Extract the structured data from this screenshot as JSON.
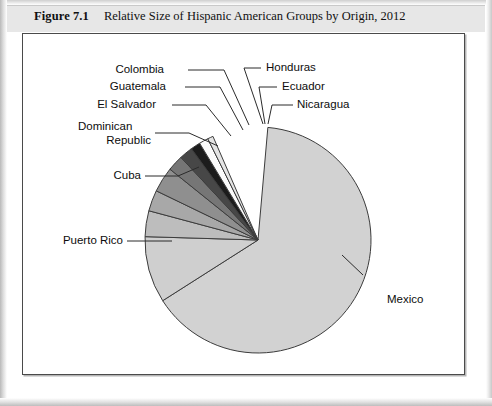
{
  "caption": {
    "figure_number": "Figure 7.1",
    "title": "Relative Size of Hispanic American Groups by Origin, 2012"
  },
  "chart_data": {
    "type": "pie",
    "title": "Relative Size of Hispanic American Groups by Origin, 2012",
    "xlabel": "",
    "ylabel": "",
    "legend_position": "none",
    "grid": false,
    "labels_as_callouts": true,
    "categories": [
      "Mexico",
      "Puerto Rico",
      "Cuba",
      "Dominican Republic",
      "El Salvador",
      "Guatemala",
      "Colombia",
      "Honduras",
      "Ecuador",
      "Nicaragua"
    ],
    "values": [
      64.6,
      9.5,
      3.7,
      3.0,
      3.6,
      2.3,
      1.9,
      1.4,
      1.3,
      0.8
    ],
    "unit": "percent",
    "slices": [
      {
        "name": "Mexico",
        "value": 64.6,
        "color": "#d2d2d2",
        "start_deg": 5.0,
        "end_deg": 237.5
      },
      {
        "name": "Puerto Rico",
        "value": 9.5,
        "color": "#cfcfcf",
        "start_deg": 237.5,
        "end_deg": 271.7
      },
      {
        "name": "Cuba",
        "value": 3.7,
        "color": "#bdbdbd",
        "start_deg": 271.7,
        "end_deg": 285.0
      },
      {
        "name": "Dominican Republic",
        "value": 3.0,
        "color": "#a8a8a8",
        "start_deg": 285.0,
        "end_deg": 295.8
      },
      {
        "name": "El Salvador",
        "value": 3.6,
        "color": "#8f8f8f",
        "start_deg": 295.8,
        "end_deg": 308.8
      },
      {
        "name": "Guatemala",
        "value": 2.3,
        "color": "#767676",
        "start_deg": 308.8,
        "end_deg": 317.0
      },
      {
        "name": "Colombia",
        "value": 1.9,
        "color": "#474747",
        "start_deg": 317.0,
        "end_deg": 323.9
      },
      {
        "name": "Honduras",
        "value": 1.4,
        "color": "#1c1c1c",
        "start_deg": 323.9,
        "end_deg": 328.9
      },
      {
        "name": "Ecuador",
        "value": 1.3,
        "color": "#fbfbfb",
        "start_deg": 328.9,
        "end_deg": 333.6
      },
      {
        "name": "Nicaragua",
        "value": 0.8,
        "color": "#e4e4e4",
        "start_deg": 333.6,
        "end_deg": 336.5
      }
    ],
    "callouts": [
      {
        "name": "Colombia",
        "label": "Colombia"
      },
      {
        "name": "Guatemala",
        "label": "Guatemala"
      },
      {
        "name": "El Salvador",
        "label": "El Salvador"
      },
      {
        "name": "Dominican Republic",
        "label_line1": "Dominican",
        "label_line2": "Republic"
      },
      {
        "name": "Cuba",
        "label": "Cuba"
      },
      {
        "name": "Puerto Rico",
        "label": "Puerto Rico"
      },
      {
        "name": "Honduras",
        "label": "Honduras"
      },
      {
        "name": "Ecuador",
        "label": "Ecuador"
      },
      {
        "name": "Nicaragua",
        "label": "Nicaragua"
      },
      {
        "name": "Mexico",
        "label": "Mexico"
      }
    ]
  },
  "colors": {
    "caption_band": "#e7e7e7",
    "frame_border": "#4a4a4a",
    "slice_outline": "#3c3c3c",
    "leader_line": "#2b2b2b",
    "text": "#0d0d0d"
  }
}
